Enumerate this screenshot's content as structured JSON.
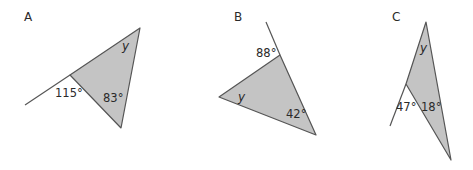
{
  "diagrams": [
    {
      "label": "A",
      "angles": {
        "exterior": "115°",
        "interior": "83°",
        "unknown": "y"
      }
    },
    {
      "label": "B",
      "angles": {
        "exterior": "88°",
        "interior": "42°",
        "unknown": "y"
      }
    },
    {
      "label": "C",
      "angles": {
        "exterior": "47°",
        "interior": "18°",
        "unknown": "y"
      }
    }
  ],
  "colors": {
    "fill": "#c4c4c4",
    "stroke": "#555555",
    "text": "#2a2a2a"
  }
}
